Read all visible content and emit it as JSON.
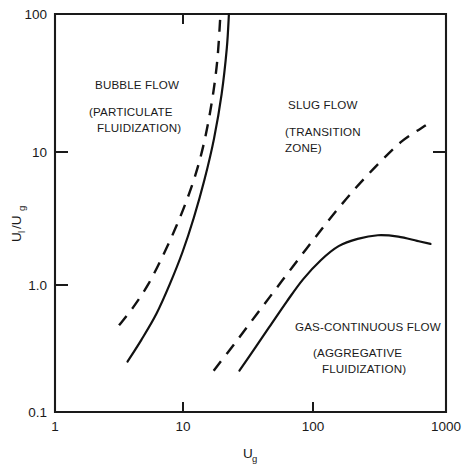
{
  "chart_data": {
    "type": "line",
    "title": "",
    "xlabel": "U_g",
    "ylabel": "U_l/U_g",
    "xscale": "log",
    "yscale": "log",
    "xlim": [
      1,
      1000
    ],
    "ylim": [
      0.1,
      100
    ],
    "grid": false,
    "legend_position": "none",
    "x_tick_labels": [
      "1",
      "10",
      "100",
      "1000"
    ],
    "x_tick_values": [
      1,
      10,
      100,
      1000
    ],
    "y_tick_labels": [
      "0.1",
      "1.0",
      "10",
      "100"
    ],
    "y_tick_values": [
      0.1,
      1.0,
      10,
      100
    ],
    "series": [
      {
        "name": "bubble-slug-upper-boundary",
        "style": "dashed",
        "points": [
          [
            3.1,
            0.45
          ],
          [
            4.0,
            0.62
          ],
          [
            5.2,
            0.92
          ],
          [
            6.6,
            1.45
          ],
          [
            8.2,
            2.3
          ],
          [
            10.0,
            3.7
          ],
          [
            12.0,
            6.2
          ],
          [
            14.0,
            11.0
          ],
          [
            16.0,
            22.0
          ],
          [
            17.6,
            45.0
          ],
          [
            18.6,
            100.0
          ]
        ]
      },
      {
        "name": "bubble-slug-lower-boundary",
        "style": "solid",
        "points": [
          [
            3.6,
            0.24
          ],
          [
            4.6,
            0.35
          ],
          [
            6.0,
            0.55
          ],
          [
            7.6,
            0.92
          ],
          [
            9.5,
            1.6
          ],
          [
            11.6,
            2.9
          ],
          [
            14.0,
            5.6
          ],
          [
            16.6,
            11.5
          ],
          [
            19.0,
            25.0
          ],
          [
            20.8,
            55.0
          ],
          [
            21.6,
            100.0
          ]
        ]
      },
      {
        "name": "slug-gas-continuous-upper-boundary",
        "style": "dashed",
        "points": [
          [
            16.5,
            0.205
          ],
          [
            24.0,
            0.33
          ],
          [
            36.0,
            0.56
          ],
          [
            55.0,
            0.97
          ],
          [
            85.0,
            1.7
          ],
          [
            130.0,
            2.9
          ],
          [
            200.0,
            4.8
          ],
          [
            310.0,
            7.6
          ],
          [
            460.0,
            11.0
          ],
          [
            700.0,
            14.5
          ]
        ]
      },
      {
        "name": "slug-gas-continuous-lower-boundary",
        "style": "solid",
        "points": [
          [
            26.0,
            0.205
          ],
          [
            34.0,
            0.3
          ],
          [
            45.0,
            0.45
          ],
          [
            60.0,
            0.68
          ],
          [
            80.0,
            1.0
          ],
          [
            110.0,
            1.4
          ],
          [
            150.0,
            1.78
          ],
          [
            210.0,
            2.02
          ],
          [
            300.0,
            2.15
          ],
          [
            430.0,
            2.1
          ],
          [
            600.0,
            1.95
          ],
          [
            760.0,
            1.85
          ]
        ]
      }
    ],
    "annotations": [
      {
        "name": "bubble-flow-region",
        "lines": [
          "BUBBLE FLOW",
          "(PARTICULATE",
          "FLUIDIZATION)"
        ],
        "x_px": 95,
        "y_px": 85
      },
      {
        "name": "slug-flow-region",
        "lines": [
          "SLUG FLOW",
          "(TRANSITION",
          "ZONE)"
        ],
        "x_px": 288,
        "y_px": 109
      },
      {
        "name": "gas-continuous-flow-region",
        "lines": [
          "GAS-CONTINUOUS FLOW",
          "(AGGREGATIVE",
          "FLUIDIZATION)"
        ],
        "x_px": 295,
        "y_px": 331
      }
    ]
  },
  "axes": {
    "y_label_main": "U",
    "y_label_sub1": "l",
    "y_label_slash": "/U",
    "y_label_sub2": "g",
    "x_label_main": "U",
    "x_label_sub": "g"
  },
  "labels": {
    "bubble_flow": "BUBBLE FLOW",
    "particulate": "(PARTICULATE",
    "fluidization_1": "FLUIDIZATION)",
    "slug_flow": "SLUG FLOW",
    "transition": "(TRANSITION",
    "zone": "ZONE)",
    "gas_continuous": "GAS-CONTINUOUS FLOW",
    "aggregative": "(AGGREGATIVE",
    "fluidization_2": "FLUIDIZATION)"
  },
  "ticks": {
    "x": [
      "1",
      "10",
      "100",
      "1000"
    ],
    "y": [
      "0.1",
      "1.0",
      "10",
      "100"
    ]
  },
  "colors": {
    "ink": "#111111",
    "background": "#ffffff"
  }
}
